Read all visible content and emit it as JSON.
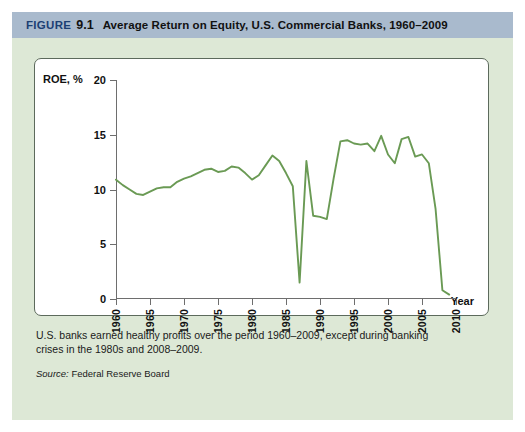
{
  "header": {
    "figure_word": "FIGURE",
    "figure_number": "9.1",
    "title": "Average Return on Equity, U.S. Commercial Banks, 1960–2009",
    "band_color": "#a9bacd",
    "figure_word_color": "#1c3f74"
  },
  "caption": "U.S. banks earned healthy profits over the period 1960–2009, except during banking crises in the 1980s and 2008–2009.",
  "source": {
    "lead": "Source:",
    "text": " Federal Reserve Board"
  },
  "chart_data": {
    "type": "line",
    "xlabel": "Year",
    "ylabel": "ROE, %",
    "xlim": [
      1960,
      2010
    ],
    "ylim": [
      0,
      20
    ],
    "grid": false,
    "legend": null,
    "line_color": "#6a9a54",
    "yticks": [
      0,
      5,
      10,
      15,
      20
    ],
    "ytick_labels": [
      "0",
      "5",
      "10",
      "15",
      "20"
    ],
    "xticks": [
      1960,
      1965,
      1970,
      1975,
      1980,
      1985,
      1990,
      1995,
      2000,
      2005,
      2010
    ],
    "xtick_labels": [
      "1960",
      "1965",
      "1970",
      "1975",
      "1980",
      "1985",
      "1990",
      "1995",
      "2000",
      "2005",
      "2010"
    ],
    "x": [
      1960,
      1961,
      1962,
      1963,
      1964,
      1965,
      1966,
      1967,
      1968,
      1969,
      1970,
      1971,
      1972,
      1973,
      1974,
      1975,
      1976,
      1977,
      1978,
      1979,
      1980,
      1981,
      1982,
      1983,
      1984,
      1985,
      1986,
      1987,
      1988,
      1989,
      1990,
      1991,
      1992,
      1993,
      1994,
      1995,
      1996,
      1997,
      1998,
      1999,
      2000,
      2001,
      2002,
      2003,
      2004,
      2005,
      2006,
      2007,
      2008,
      2009
    ],
    "values": [
      10.9,
      10.4,
      10.0,
      9.6,
      9.5,
      9.8,
      10.1,
      10.2,
      10.2,
      10.7,
      11.0,
      11.2,
      11.5,
      11.8,
      11.9,
      11.6,
      11.7,
      12.1,
      12.0,
      11.5,
      10.9,
      11.3,
      12.2,
      13.1,
      12.6,
      11.5,
      10.3,
      1.5,
      12.6,
      7.6,
      7.5,
      7.3,
      11.0,
      14.4,
      14.5,
      14.2,
      14.1,
      14.2,
      13.5,
      14.9,
      13.2,
      12.4,
      14.6,
      14.8,
      13.0,
      13.2,
      12.4,
      8.2,
      0.8,
      0.4
    ]
  }
}
